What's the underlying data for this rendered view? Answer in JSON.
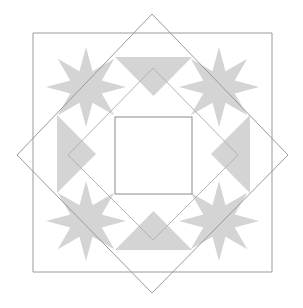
{
  "figure": {
    "canvas": {
      "width": 303,
      "height": 308,
      "background": "#ffffff"
    },
    "colors": {
      "star_fill": "#d4d4d4",
      "geese_fill": "#d4d4d4",
      "outline_stroke": "#9a9a9a",
      "center_square_stroke": "#8a8a8a",
      "center_square_fill": "#ffffff",
      "background": "#ffffff"
    },
    "stroke_width": 1,
    "center": {
      "x": 152.5,
      "y": 153.5
    }
  },
  "shapes": {
    "outer_square": {
      "name": "outer-square",
      "points": "33,33 272,33 272,272 33,272",
      "stroke": "#9a9a9a"
    },
    "outer_diamond": {
      "name": "outer-diamond",
      "points": "152,14 288,155 152,293 17,155",
      "stroke": "#9a9a9a"
    },
    "inner_diamond": {
      "name": "inner-diamond",
      "points": "153,68 238,155 153,240 68,155",
      "stroke": "#b4b4b4"
    },
    "center_square": {
      "name": "center-square",
      "x": 115,
      "y": 117,
      "width": 77,
      "height": 77,
      "fill": "#ffffff",
      "stroke": "#8a8a8a"
    },
    "stars": [
      {
        "name": "star-top-left",
        "cx": 86,
        "cy": 87,
        "outer": 40,
        "inner": 17
      },
      {
        "name": "star-top-right",
        "cx": 219,
        "cy": 87,
        "outer": 40,
        "inner": 17
      },
      {
        "name": "star-bottom-left",
        "cx": 86,
        "cy": 221,
        "outer": 40,
        "inner": 17
      },
      {
        "name": "star-bottom-right",
        "cx": 219,
        "cy": 221,
        "outer": 40,
        "inner": 17
      }
    ],
    "geese": [
      {
        "name": "geese-top",
        "points": "115,57 192,57 153.5,96"
      },
      {
        "name": "geese-bottom",
        "points": "115,250 192,250 153.5,211"
      },
      {
        "name": "geese-left",
        "points": "57,115 57,193 96,154"
      },
      {
        "name": "geese-right",
        "points": "250,115 250,193 211,154"
      }
    ]
  }
}
